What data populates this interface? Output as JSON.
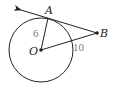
{
  "diagram": {
    "type": "geometry-circle-tangent",
    "colors": {
      "stroke": "#222222",
      "length_label": "#7a7a7a",
      "background": "#ffffff"
    },
    "circle": {
      "center_label": "O",
      "cx": 41,
      "cy": 50,
      "r": 32
    },
    "points": {
      "A": {
        "label": "A",
        "x": 48,
        "y": 18
      },
      "B": {
        "label": "B",
        "x": 97,
        "y": 33
      },
      "O": {
        "label": "O",
        "x": 41,
        "y": 50
      }
    },
    "segments": [
      {
        "from": "O",
        "to": "A",
        "length_label": "6"
      },
      {
        "from": "O",
        "to": "B",
        "length_label": "10"
      }
    ],
    "tangent_line": {
      "from": "B",
      "through": "A",
      "arrow_end": {
        "x": 20,
        "y": 10
      }
    }
  }
}
